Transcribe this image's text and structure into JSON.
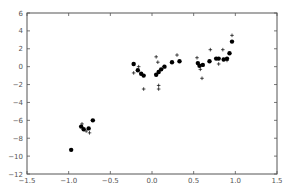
{
  "chart_data": {
    "type": "scatter",
    "title": "",
    "xlabel": "",
    "ylabel": "",
    "xlim": [
      -1.5,
      1.5
    ],
    "ylim": [
      -12,
      6
    ],
    "grid": false,
    "legend": null,
    "x_ticks": [
      -1.5,
      -1.0,
      -0.5,
      0.0,
      0.5,
      1.0,
      1.5
    ],
    "x_tick_labels": [
      "−1.5",
      "−1.0",
      "−0.5",
      "0.0",
      "0.5",
      "1.0",
      "1.5"
    ],
    "y_ticks": [
      6,
      4,
      2,
      0,
      -2,
      -4,
      -6,
      -8,
      -10,
      -12
    ],
    "y_tick_labels": [
      "6",
      "4",
      "2",
      "0",
      "−2",
      "−4",
      "−6",
      "−8",
      "−10",
      "−12"
    ],
    "series": [
      {
        "name": "dots",
        "marker": "o",
        "color": "#000000",
        "points": [
          [
            -0.97,
            -9.3
          ],
          [
            -0.85,
            -6.7
          ],
          [
            -0.82,
            -7.0
          ],
          [
            -0.76,
            -6.9
          ],
          [
            -0.71,
            -6.0
          ],
          [
            -0.22,
            0.3
          ],
          [
            -0.17,
            -0.4
          ],
          [
            -0.13,
            -0.8
          ],
          [
            -0.1,
            -1.0
          ],
          [
            0.05,
            -0.9
          ],
          [
            0.08,
            -0.6
          ],
          [
            0.11,
            -0.3
          ],
          [
            0.15,
            0.0
          ],
          [
            0.24,
            0.5
          ],
          [
            0.33,
            0.6
          ],
          [
            0.55,
            0.4
          ],
          [
            0.57,
            0.1
          ],
          [
            0.61,
            0.2
          ],
          [
            0.69,
            0.6
          ],
          [
            0.77,
            0.9
          ],
          [
            0.8,
            0.9
          ],
          [
            0.86,
            0.8
          ],
          [
            0.9,
            0.9
          ],
          [
            0.93,
            1.5
          ],
          [
            0.96,
            2.8
          ]
        ]
      },
      {
        "name": "crosses",
        "marker": "+",
        "color": "#000000",
        "points": [
          [
            -0.84,
            -6.4
          ],
          [
            -0.79,
            -7.2
          ],
          [
            -0.75,
            -7.4
          ],
          [
            -0.22,
            -0.7
          ],
          [
            -0.16,
            0.0
          ],
          [
            -0.1,
            -2.5
          ],
          [
            0.05,
            1.1
          ],
          [
            0.07,
            0.5
          ],
          [
            0.08,
            -2.1
          ],
          [
            0.08,
            -2.5
          ],
          [
            0.14,
            0.0
          ],
          [
            0.3,
            1.3
          ],
          [
            0.54,
            1.0
          ],
          [
            0.58,
            -0.3
          ],
          [
            0.6,
            -1.3
          ],
          [
            0.7,
            1.9
          ],
          [
            0.8,
            0.3
          ],
          [
            0.85,
            1.9
          ],
          [
            0.9,
            0.7
          ],
          [
            0.96,
            3.5
          ]
        ]
      }
    ]
  },
  "colors": {
    "axis": "#555555",
    "marker": "#000000",
    "background": "#ffffff"
  }
}
